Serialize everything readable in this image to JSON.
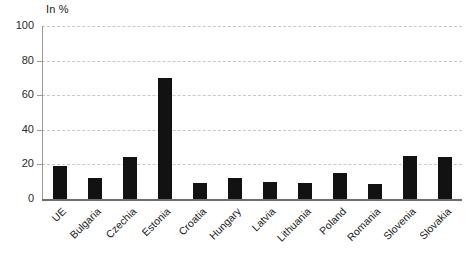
{
  "chart_data": {
    "type": "bar",
    "title": "",
    "subtitle": "",
    "unit_label": "In %",
    "xlabel": "",
    "ylabel": "In %",
    "ylim": [
      0,
      100
    ],
    "yticks": [
      0,
      20,
      40,
      60,
      80,
      100
    ],
    "ytick_labels": [
      "0",
      "20",
      "40",
      "60",
      "80",
      "100"
    ],
    "grid": true,
    "legend": "none",
    "bar_color": "#121212",
    "gridline_color": "#c9c9c9",
    "axis_color": "#6e6e6e",
    "categories": [
      "UE",
      "Bulgaria",
      "Czechia",
      "Estonia",
      "Croatia",
      "Hungary",
      "Latvia",
      "Lithuania",
      "Poland",
      "Romania",
      "Slovenia",
      "Slovakia"
    ],
    "values": [
      19,
      12,
      24,
      70,
      9,
      12,
      10,
      9,
      15,
      8.5,
      25,
      24.5
    ],
    "series": [
      {
        "name": "In %",
        "values": [
          19,
          12,
          24,
          70,
          9,
          12,
          10,
          9,
          15,
          8.5,
          25,
          24.5
        ]
      }
    ]
  }
}
